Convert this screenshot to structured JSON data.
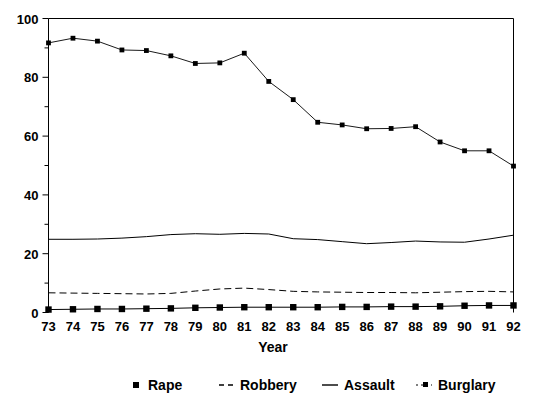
{
  "chart_data": {
    "type": "line",
    "title": "",
    "xlabel": "Year",
    "ylabel": "",
    "categories": [
      "73",
      "74",
      "75",
      "76",
      "77",
      "78",
      "79",
      "80",
      "81",
      "82",
      "83",
      "84",
      "85",
      "86",
      "87",
      "88",
      "89",
      "90",
      "91",
      "92"
    ],
    "ylim": [
      0,
      100
    ],
    "xlim_labels": [
      "73",
      "92"
    ],
    "y_ticks_major": [
      0,
      20,
      40,
      60,
      80,
      100
    ],
    "y_ticks_minor": [
      10,
      30,
      50,
      70,
      90
    ],
    "grid": false,
    "legend_position": "bottom",
    "series": [
      {
        "name": "Rape",
        "style": "solid-with-square-markers",
        "color": "#000000",
        "values": [
          1.0,
          1.1,
          1.2,
          1.2,
          1.3,
          1.4,
          1.6,
          1.7,
          1.8,
          1.8,
          1.8,
          1.8,
          1.9,
          1.9,
          2.0,
          2.0,
          2.1,
          2.3,
          2.4,
          2.4
        ]
      },
      {
        "name": "Robbery",
        "style": "dashed",
        "color": "#000000",
        "values": [
          6.7,
          6.6,
          6.5,
          6.4,
          6.3,
          6.5,
          7.3,
          8.0,
          8.3,
          7.8,
          7.2,
          7.0,
          6.9,
          6.8,
          6.8,
          6.7,
          6.9,
          7.1,
          7.2,
          7.0
        ]
      },
      {
        "name": "Assault",
        "style": "solid",
        "color": "#000000",
        "values": [
          24.9,
          24.9,
          25.0,
          25.3,
          25.8,
          26.5,
          26.8,
          26.6,
          26.9,
          26.7,
          25.1,
          24.8,
          24.1,
          23.4,
          23.8,
          24.3,
          24.0,
          23.9,
          25.0,
          26.3
        ]
      },
      {
        "name": "Burglary",
        "style": "dotted-with-square-markers",
        "color": "#000000",
        "values": [
          91.7,
          93.3,
          92.3,
          89.3,
          89.1,
          87.3,
          84.7,
          84.9,
          88.2,
          78.6,
          72.4,
          64.7,
          63.8,
          62.5,
          62.6,
          63.2,
          58.0,
          55.0,
          55.0,
          49.8
        ]
      }
    ]
  },
  "axis": {
    "y_tick_labels": [
      "0",
      "20",
      "40",
      "60",
      "80",
      "100"
    ],
    "x_tick_labels": [
      "73",
      "74",
      "75",
      "76",
      "77",
      "78",
      "79",
      "80",
      "81",
      "82",
      "83",
      "84",
      "85",
      "86",
      "87",
      "88",
      "89",
      "90",
      "91",
      "92"
    ],
    "x_title": "Year"
  },
  "legend": {
    "items": [
      {
        "label": "Rape",
        "glyph": "square-marker"
      },
      {
        "label": "Robbery",
        "glyph": "dashed-line"
      },
      {
        "label": "Assault",
        "glyph": "solid-line"
      },
      {
        "label": "Burglary",
        "glyph": "dotted-line-with-dot"
      }
    ]
  }
}
